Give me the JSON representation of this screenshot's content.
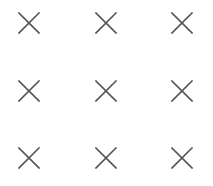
{
  "grid": {
    "rows": 3,
    "columns": 3,
    "icon": "close-icon",
    "stroke_color": "#555555",
    "background": "#ffffff",
    "items": [
      {
        "row": 0,
        "col": 0,
        "icon": "close-icon",
        "cx": 29,
        "cy": 23
      },
      {
        "row": 0,
        "col": 1,
        "icon": "close-icon",
        "cx": 106,
        "cy": 23
      },
      {
        "row": 0,
        "col": 2,
        "icon": "close-icon",
        "cx": 182,
        "cy": 23
      },
      {
        "row": 1,
        "col": 0,
        "icon": "close-icon",
        "cx": 29,
        "cy": 91
      },
      {
        "row": 1,
        "col": 1,
        "icon": "close-icon",
        "cx": 106,
        "cy": 91
      },
      {
        "row": 1,
        "col": 2,
        "icon": "close-icon",
        "cx": 182,
        "cy": 91
      },
      {
        "row": 2,
        "col": 0,
        "icon": "close-icon",
        "cx": 29,
        "cy": 158
      },
      {
        "row": 2,
        "col": 1,
        "icon": "close-icon",
        "cx": 106,
        "cy": 158
      },
      {
        "row": 2,
        "col": 2,
        "icon": "close-icon",
        "cx": 182,
        "cy": 158
      }
    ]
  }
}
